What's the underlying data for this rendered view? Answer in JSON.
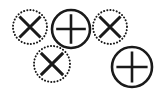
{
  "figure": {
    "background_color": "#ffffff",
    "stroke_color": "#1a1a1a",
    "width": 168,
    "height": 110
  },
  "legend": {
    "dotted_meaning": "dotted outline circle with X mark",
    "solid_meaning": "solid outline circle with plus mark"
  },
  "nodes": [
    {
      "id": "node-1",
      "name": "dotted-x-circle-top-left",
      "outline": "dotted",
      "glyph": "x",
      "glyph_label": "X",
      "cx": 30,
      "cy": 27,
      "r": 17,
      "stroke_width": 2,
      "glyph_stroke_width": 3,
      "z": 1
    },
    {
      "id": "node-2",
      "name": "solid-plus-circle-top-center",
      "outline": "solid",
      "glyph": "plus",
      "glyph_label": "+",
      "cx": 71,
      "cy": 29,
      "r": 19,
      "stroke_width": 2.6,
      "glyph_stroke_width": 2.6,
      "z": 4
    },
    {
      "id": "node-3",
      "name": "dotted-x-circle-top-right",
      "outline": "dotted",
      "glyph": "x",
      "glyph_label": "X",
      "cx": 110,
      "cy": 27,
      "r": 17,
      "stroke_width": 2,
      "glyph_stroke_width": 3,
      "z": 2
    },
    {
      "id": "node-4",
      "name": "dotted-x-circle-bottom-left",
      "outline": "dotted",
      "glyph": "x",
      "glyph_label": "X",
      "cx": 52,
      "cy": 64,
      "r": 18,
      "stroke_width": 2,
      "glyph_stroke_width": 3,
      "z": 3
    },
    {
      "id": "node-5",
      "name": "solid-plus-circle-bottom-right",
      "outline": "solid",
      "glyph": "plus",
      "glyph_label": "+",
      "cx": 132,
      "cy": 67,
      "r": 20,
      "stroke_width": 2.6,
      "glyph_stroke_width": 2.6,
      "z": 5
    }
  ],
  "counts": {
    "total_circles": 5,
    "dotted_x_circles": 3,
    "solid_plus_circles": 2
  }
}
